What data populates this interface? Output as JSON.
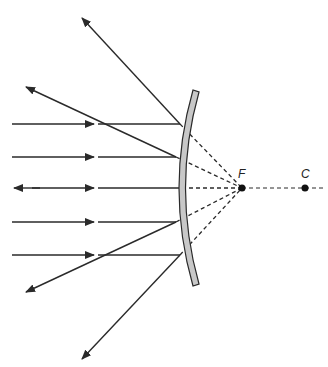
{
  "diagram": {
    "labels": {
      "focal_point": "F",
      "center_of_curvature": "C"
    },
    "colors": {
      "ray": "#2a2a2a",
      "mirror_fill": "#c8c8c8",
      "mirror_edge": "#2a2a2a",
      "background": "#ffffff"
    },
    "incident_rays_y": [
      124,
      157,
      188,
      222,
      255
    ],
    "points": {
      "F": {
        "x": 242,
        "y": 188
      },
      "C": {
        "x": 305,
        "y": 188
      }
    }
  }
}
